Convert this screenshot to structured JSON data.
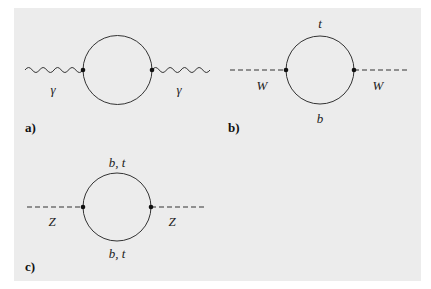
{
  "figure": {
    "background": "#ececec",
    "line_color": "#333333",
    "diagrams": [
      {
        "tag": "a)",
        "external_line": "wavy",
        "left_label": "γ",
        "right_label": "γ",
        "top_label": "",
        "bottom_label": ""
      },
      {
        "tag": "b)",
        "external_line": "dashed",
        "left_label": "W",
        "right_label": "W",
        "top_label": "t",
        "bottom_label": "b"
      },
      {
        "tag": "c)",
        "external_line": "dashed",
        "left_label": "Z",
        "right_label": "Z",
        "top_label": "b, t",
        "bottom_label": "b, t"
      }
    ]
  }
}
